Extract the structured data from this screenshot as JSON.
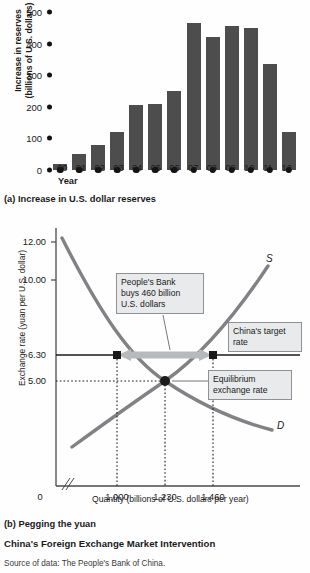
{
  "figure": {
    "title": "China's Foreign Exchange Market Intervention",
    "source": "Source of data: The People's Bank of China.",
    "caption_a": "(a) Increase in U.S. dollar reserves",
    "caption_b": "(b) Pegging the yuan"
  },
  "colors": {
    "bar_fill": "#4d4d4d",
    "curve": "#808285",
    "callout_fill": "#e8eaec",
    "callout_border": "#8d9195",
    "arrow": "#b7babd",
    "marker": "#1a1a1a"
  },
  "chart_data": [
    {
      "type": "bar",
      "title": "(a) Increase in U.S. dollar reserves",
      "xlabel": "Year",
      "ylabel": "Increase in reserves (billions of U.S. dollars)",
      "ylim": [
        0,
        500
      ],
      "yticks": [
        0,
        100,
        200,
        300,
        400,
        500
      ],
      "grid": false,
      "categories": [
        "00",
        "01",
        "02",
        "03",
        "04",
        "05",
        "06",
        "07",
        "08",
        "09",
        "10",
        "11",
        "12"
      ],
      "values": [
        20,
        50,
        80,
        120,
        207,
        210,
        250,
        465,
        420,
        455,
        450,
        335,
        120
      ]
    },
    {
      "type": "line",
      "title": "(b) Pegging the yuan",
      "xlabel": "Quantity (billions of U.S. dollars per year)",
      "ylabel": "Exchange rate (yuan per U.S. dollar)",
      "yticks": [
        "12.00",
        "10.00",
        "6.30",
        "5.00"
      ],
      "ytick_values": [
        12.0,
        10.0,
        6.3,
        5.0
      ],
      "xticks": [
        "1,000",
        "1,230",
        "1,460"
      ],
      "xtick_values": [
        1000,
        1230,
        1460
      ],
      "x_origin_label": "0",
      "axis_break": true,
      "series": [
        {
          "name": "D",
          "label": "D",
          "note": "demand for U.S. dollars, downward sloping"
        },
        {
          "name": "S",
          "label": "S",
          "note": "supply of U.S. dollars, upward sloping"
        }
      ],
      "equilibrium": {
        "price": 5.0,
        "quantity": 1230
      },
      "target_rate": {
        "price": 6.3,
        "quantity_demanded": 1000,
        "quantity_supplied": 1460
      },
      "intervention_billions": 460,
      "annotations": [
        {
          "id": "intervention",
          "text": "People's Bank buys 460 billion U.S. dollars"
        },
        {
          "id": "target",
          "text": "China's target rate"
        },
        {
          "id": "equilibrium",
          "text": "Equilibrium exchange rate"
        }
      ]
    }
  ],
  "panel_a": {
    "ylabel_line1": "Increase in reserves",
    "ylabel_line2": "(billions of U.S. dollars)",
    "xlabel": "Year",
    "yticks": [
      "500",
      "400",
      "300",
      "200",
      "100",
      "0"
    ],
    "xticks": [
      "00",
      "01",
      "02",
      "03",
      "04",
      "05",
      "06",
      "07",
      "08",
      "09",
      "10",
      "11",
      "12"
    ]
  },
  "panel_b": {
    "ylabel": "Exchange rate (yuan per U.S. dollar)",
    "xlabel": "Quantity (billions of U.S. dollars per year)",
    "ytick_1200": "12.00",
    "ytick_1000": "10.00",
    "ytick_630": "6.30",
    "ytick_500": "5.00",
    "xtick_0": "0",
    "xtick_1000": "1,000",
    "xtick_1230": "1,230",
    "xtick_1460": "1,460",
    "label_s": "S",
    "label_d": "D",
    "callout_intervention_l1": "People's Bank",
    "callout_intervention_l2": "buys 460 billion",
    "callout_intervention_l3": "U.S. dollars",
    "callout_target_l1": "China's target",
    "callout_target_l2": "rate",
    "callout_equilibrium_l1": "Equilibrium",
    "callout_equilibrium_l2": "exchange rate"
  }
}
